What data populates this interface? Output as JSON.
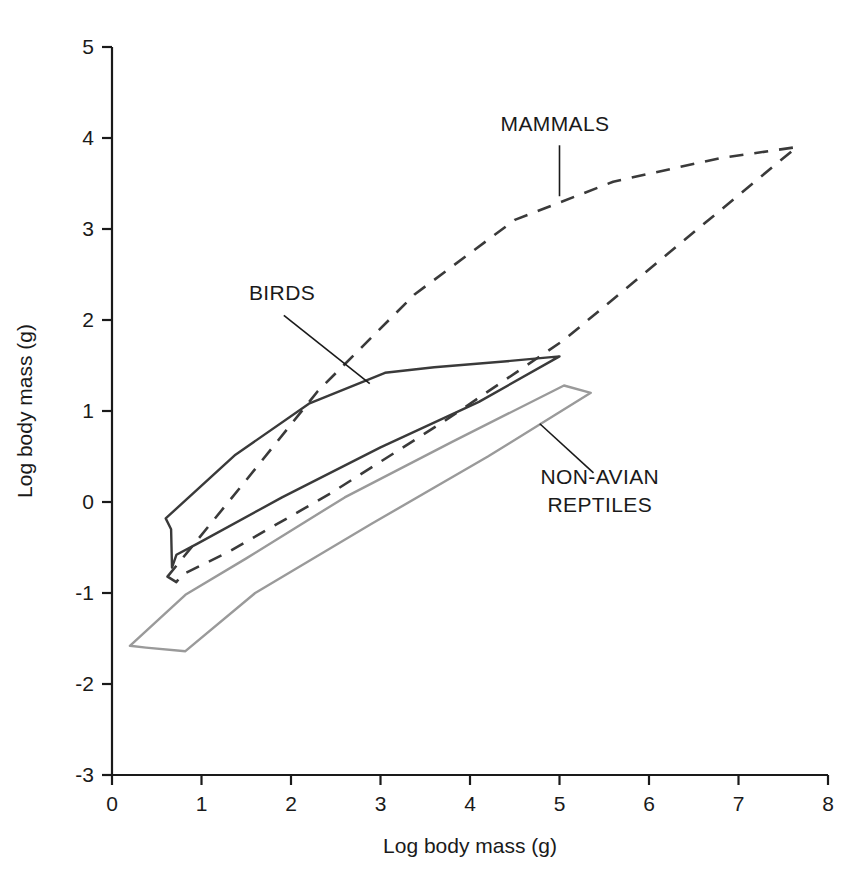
{
  "chart_data": {
    "type": "line",
    "title": "",
    "subtitle": "",
    "xlabel": "Log body mass (g)",
    "ylabel": "Log body mass (g)",
    "xlim": [
      0,
      8
    ],
    "ylim": [
      -3,
      5
    ],
    "xticks": [
      "0",
      "1",
      "2",
      "3",
      "4",
      "5",
      "6",
      "7",
      "8"
    ],
    "yticks": [
      "5",
      "4",
      "3",
      "2",
      "1",
      "0",
      "-1",
      "-2",
      "-3"
    ],
    "grid": false,
    "legend_position": "inline-annotations",
    "series": [
      {
        "name": "MAMMALS",
        "style": "dashed",
        "color": "#3a3a3a",
        "closed": true,
        "points": [
          [
            0.62,
            -0.82
          ],
          [
            1.45,
            0.18
          ],
          [
            2.3,
            1.22
          ],
          [
            3.38,
            2.28
          ],
          [
            4.5,
            3.1
          ],
          [
            5.6,
            3.52
          ],
          [
            6.8,
            3.78
          ],
          [
            7.65,
            3.9
          ],
          [
            6.2,
            2.72
          ],
          [
            5.05,
            1.78
          ],
          [
            3.7,
            0.88
          ],
          [
            2.45,
            0.1
          ],
          [
            1.3,
            -0.55
          ],
          [
            0.78,
            -0.8
          ],
          [
            0.72,
            -0.88
          ]
        ]
      },
      {
        "name": "BIRDS",
        "style": "solid",
        "color": "#3a3a3a",
        "closed": true,
        "points": [
          [
            0.6,
            -0.18
          ],
          [
            1.38,
            0.52
          ],
          [
            2.2,
            1.08
          ],
          [
            3.05,
            1.42
          ],
          [
            3.6,
            1.48
          ],
          [
            4.45,
            1.55
          ],
          [
            5.0,
            1.6
          ],
          [
            4.1,
            1.1
          ],
          [
            3.0,
            0.6
          ],
          [
            1.9,
            0.05
          ],
          [
            0.95,
            -0.46
          ],
          [
            0.72,
            -0.58
          ],
          [
            0.67,
            -0.72
          ],
          [
            0.66,
            -0.3
          ]
        ]
      },
      {
        "name": "NON-AVIAN REPTILES",
        "style": "solid",
        "color": "#9a9a9a",
        "closed": true,
        "points": [
          [
            0.2,
            -1.58
          ],
          [
            0.82,
            -1.02
          ],
          [
            1.5,
            -0.62
          ],
          [
            2.6,
            0.05
          ],
          [
            3.8,
            0.66
          ],
          [
            5.05,
            1.28
          ],
          [
            5.35,
            1.2
          ],
          [
            4.2,
            0.5
          ],
          [
            2.9,
            -0.24
          ],
          [
            1.6,
            -1.0
          ],
          [
            0.82,
            -1.64
          ],
          [
            0.38,
            -1.6
          ]
        ]
      }
    ],
    "annotations": [
      {
        "label": "MAMMALS",
        "lines": [
          "MAMMALS"
        ],
        "text_x": 4.95,
        "text_y": 4.08,
        "leader_from_x": 5.0,
        "leader_from_y": 3.92,
        "leader_to_x": 5.0,
        "leader_to_y": 3.36
      },
      {
        "label": "BIRDS",
        "lines": [
          "BIRDS"
        ],
        "text_x": 1.9,
        "text_y": 2.22,
        "leader_from_x": 1.92,
        "leader_from_y": 2.05,
        "leader_to_x": 2.88,
        "leader_to_y": 1.3
      },
      {
        "label": "NON-AVIAN REPTILES",
        "lines": [
          "NON-AVIAN",
          "REPTILES"
        ],
        "text_x": 5.45,
        "text_y": 0.2,
        "leader_from_x": 5.38,
        "leader_from_y": 0.32,
        "leader_to_x": 4.78,
        "leader_to_y": 0.86
      }
    ]
  },
  "axes": {
    "x_title": "Log body mass (g)",
    "y_title": "Log body mass (g)"
  }
}
